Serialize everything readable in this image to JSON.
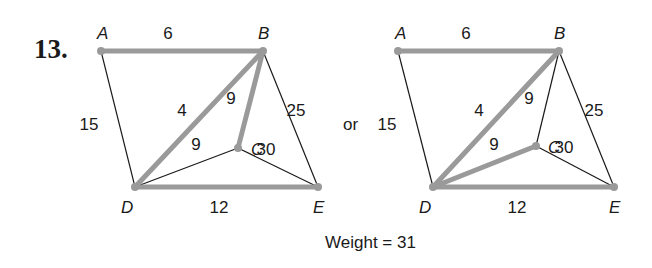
{
  "problem_number": "13.",
  "connector": "or",
  "weight_label": "Weight = 31",
  "colors": {
    "highlight_edge": "#9a9a9a",
    "normal_edge": "#1a1a1a",
    "text": "#1a1a1a"
  },
  "graphs": [
    {
      "id": "left",
      "vertices": [
        {
          "name": "A",
          "x": 101,
          "y": 51,
          "lx": 97,
          "ly": 39
        },
        {
          "name": "B",
          "x": 263,
          "y": 51,
          "lx": 258,
          "ly": 39
        },
        {
          "name": "C",
          "x": 238,
          "y": 148,
          "lx": 251,
          "ly": 155
        },
        {
          "name": "D",
          "x": 135,
          "y": 187,
          "lx": 121,
          "ly": 213
        },
        {
          "name": "E",
          "x": 318,
          "y": 187,
          "lx": 313,
          "ly": 213
        }
      ],
      "edges": [
        {
          "from": "A",
          "to": "B",
          "weight": "6",
          "highlight": true,
          "lx": 168,
          "ly": 39
        },
        {
          "from": "A",
          "to": "D",
          "weight": "15",
          "highlight": false,
          "lx": 89,
          "ly": 130
        },
        {
          "from": "B",
          "to": "D",
          "weight": "4",
          "highlight": true,
          "lx": 182,
          "ly": 116
        },
        {
          "from": "B",
          "to": "C",
          "weight": "9",
          "highlight": true,
          "lx": 231,
          "ly": 104
        },
        {
          "from": "B",
          "to": "E",
          "weight": "25",
          "highlight": false,
          "lx": 296,
          "ly": 116
        },
        {
          "from": "D",
          "to": "C",
          "weight": "9",
          "highlight": false,
          "lx": 196,
          "ly": 150
        },
        {
          "from": "C",
          "to": "E",
          "weight": "30",
          "highlight": false,
          "lx": 266,
          "ly": 155
        },
        {
          "from": "D",
          "to": "E",
          "weight": "12",
          "highlight": true,
          "lx": 219,
          "ly": 213
        }
      ]
    },
    {
      "id": "right",
      "vertices": [
        {
          "name": "A",
          "x": 398,
          "y": 51,
          "lx": 395,
          "ly": 39
        },
        {
          "name": "B",
          "x": 559,
          "y": 51,
          "lx": 554,
          "ly": 39
        },
        {
          "name": "C",
          "x": 536,
          "y": 146,
          "lx": 548,
          "ly": 153
        },
        {
          "name": "D",
          "x": 433,
          "y": 187,
          "lx": 419,
          "ly": 213
        },
        {
          "name": "E",
          "x": 614,
          "y": 187,
          "lx": 609,
          "ly": 213
        }
      ],
      "edges": [
        {
          "from": "A",
          "to": "B",
          "weight": "6",
          "highlight": true,
          "lx": 466,
          "ly": 39
        },
        {
          "from": "A",
          "to": "D",
          "weight": "15",
          "highlight": false,
          "lx": 387,
          "ly": 130
        },
        {
          "from": "B",
          "to": "D",
          "weight": "4",
          "highlight": true,
          "lx": 479,
          "ly": 116
        },
        {
          "from": "B",
          "to": "C",
          "weight": "9",
          "highlight": false,
          "lx": 529,
          "ly": 104
        },
        {
          "from": "B",
          "to": "E",
          "weight": "25",
          "highlight": false,
          "lx": 594,
          "ly": 116
        },
        {
          "from": "D",
          "to": "C",
          "weight": "9",
          "highlight": true,
          "lx": 494,
          "ly": 150
        },
        {
          "from": "C",
          "to": "E",
          "weight": "30",
          "highlight": false,
          "lx": 564,
          "ly": 153
        },
        {
          "from": "D",
          "to": "E",
          "weight": "12",
          "highlight": true,
          "lx": 517,
          "ly": 213
        }
      ]
    }
  ]
}
